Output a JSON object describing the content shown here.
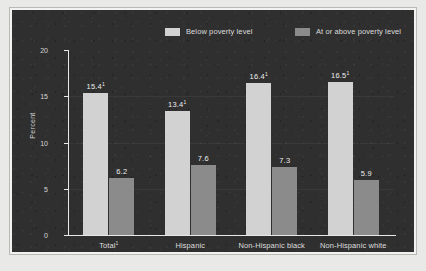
{
  "chart_data": {
    "type": "bar",
    "title": "",
    "subtitle": "",
    "xlabel": "",
    "ylabel": "Percent",
    "ylim": [
      0,
      20
    ],
    "yticks": [
      "0",
      "5",
      "10",
      "15",
      "20"
    ],
    "grid": true,
    "legend_position": "top",
    "categories": [
      "Total",
      "Hispanic",
      "Non-Hispanic black",
      "Non-Hispanic white"
    ],
    "category_markers": [
      "1",
      "",
      "",
      ""
    ],
    "series": [
      {
        "name": "Below poverty level",
        "color": "#d2d2d2",
        "values": [
          15.4,
          13.4,
          16.4,
          16.5
        ],
        "value_labels": [
          "15.4",
          "13.4",
          "16.4",
          "16.5"
        ],
        "value_markers": [
          "1",
          "1",
          "1",
          "1"
        ]
      },
      {
        "name": "At or above poverty level",
        "color": "#8b8b8b",
        "values": [
          6.2,
          7.6,
          7.3,
          5.9
        ],
        "value_labels": [
          "6.2",
          "7.6",
          "7.3",
          "5.9"
        ],
        "value_markers": [
          "",
          "",
          "",
          ""
        ]
      }
    ]
  },
  "legend": {
    "entries": [
      {
        "label": "Below poverty level",
        "color": "#d2d2d2"
      },
      {
        "label": "At or above poverty level",
        "color": "#8b8b8b"
      }
    ]
  },
  "colors": {
    "panel_background": "#2f2f2f",
    "figure_background": "#e9e9e7",
    "axis": "#e8e8e8",
    "text": "#dcdcdc",
    "series_below": "#d2d2d2",
    "series_at_or_above": "#8b8b8b"
  }
}
